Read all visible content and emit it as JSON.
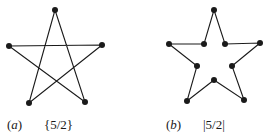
{
  "figures": [
    {
      "id": "a",
      "label_letter": "a",
      "label_open": "(",
      "label_close": ")",
      "symbol": "{5/2}",
      "description": "star polygon (pentagram) with 5 vertices",
      "vertices": [
        [
          55,
          10
        ],
        [
          102,
          45
        ],
        [
          85,
          102
        ],
        [
          29,
          103
        ],
        [
          9,
          46
        ]
      ],
      "edges_order": [
        0,
        2,
        4,
        1,
        3,
        0
      ]
    },
    {
      "id": "b",
      "label_letter": "b",
      "label_open": "(",
      "label_close": ")",
      "symbol": "|5/2|",
      "description": "star-shaped decagon outline with 10 vertices",
      "vertices": [
        [
          214,
          10
        ],
        [
          225,
          44
        ],
        [
          260,
          43
        ],
        [
          232,
          66
        ],
        [
          244,
          100
        ],
        [
          214,
          80
        ],
        [
          187,
          101
        ],
        [
          197,
          66
        ],
        [
          169,
          44
        ],
        [
          204,
          44
        ]
      ]
    }
  ],
  "style": {
    "stroke": "#1a1a1a",
    "dot_radius": 3
  }
}
